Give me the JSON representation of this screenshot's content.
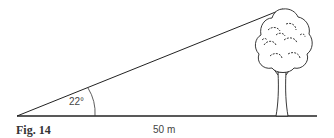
{
  "figure": {
    "caption": "Fig. 14",
    "angle_label": "22°",
    "distance_label": "50 m",
    "elements": [
      "ground-line",
      "line-of-sight",
      "angle-arc",
      "tree"
    ]
  }
}
